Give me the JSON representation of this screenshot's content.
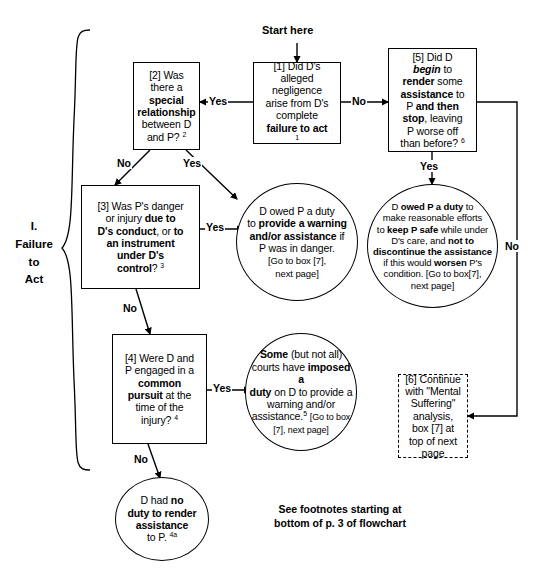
{
  "page": {
    "section_label": "I.\nFailure\nto\nAct",
    "start_label": "Start here",
    "footer_note": "See footnotes starting at\nbottom of p. 3 of flowchart"
  },
  "nodes": {
    "box1": {
      "id": "[1]",
      "text": "[1] Did D's alleged negligence arise from D's complete failure to act ¹",
      "shape": "rect"
    },
    "box2": {
      "id": "[2]",
      "text": "[2] Was there a special relationship between D and P? ²",
      "shape": "rect"
    },
    "box3": {
      "id": "[3]",
      "text": "[3] Was P's danger or injury due to D's conduct, or to an instrument under D's control? ³",
      "shape": "rect"
    },
    "box4": {
      "id": "[4]",
      "text": "[4] Were D and P engaged in a common pursuit at the time of the injury? ⁴",
      "shape": "rect"
    },
    "box5": {
      "id": "[5]",
      "text": "[5] Did D begin to render some assistance to P and then stop, leaving P worse off than before? ⁶",
      "shape": "rect"
    },
    "box6": {
      "id": "[6]",
      "text": "[6] Continue with \"Mental Suffering\" analysis, box [7] at top of next page",
      "shape": "rect-dashed"
    },
    "oval_duty_warning": {
      "text": "D owed P a duty to provide a warning and/or assistance if P was in danger. [Go to box [7], next page]",
      "shape": "oval"
    },
    "oval_duty_safe": {
      "text": "D owed P a duty to make reasonable efforts to keep P safe while under D's care, and not to discontinue the assistance if this would worsen P's condition. [Go to box[7], next page]",
      "shape": "oval"
    },
    "oval_some_courts": {
      "text": "Some (but not all) courts have imposed a duty on D to provide a warning and/or assistance.⁵ [Go to box [7], next page]",
      "shape": "oval"
    },
    "oval_no_duty": {
      "text": "D had no duty to render assistance to P. ⁴ᵃ",
      "shape": "oval"
    }
  },
  "edges": [
    {
      "id": "e1",
      "from": "box1",
      "to": "box2",
      "label": "Yes"
    },
    {
      "id": "e2",
      "from": "box1",
      "to": "box5",
      "label": "No"
    },
    {
      "id": "e3",
      "from": "box2",
      "to": "oval_duty_warning",
      "label": "Yes"
    },
    {
      "id": "e4",
      "from": "box2",
      "to": "box3",
      "label": "No"
    },
    {
      "id": "e5",
      "from": "box3",
      "to": "oval_duty_warning",
      "label": "Yes"
    },
    {
      "id": "e6",
      "from": "box3",
      "to": "box4",
      "label": "No"
    },
    {
      "id": "e7",
      "from": "box4",
      "to": "oval_some_courts",
      "label": "Yes"
    },
    {
      "id": "e8",
      "from": "box4",
      "to": "oval_no_duty",
      "label": "No"
    },
    {
      "id": "e9",
      "from": "box5",
      "to": "oval_duty_safe",
      "label": "Yes"
    },
    {
      "id": "e10",
      "from": "box5",
      "to": "box6",
      "label": "No"
    }
  ]
}
